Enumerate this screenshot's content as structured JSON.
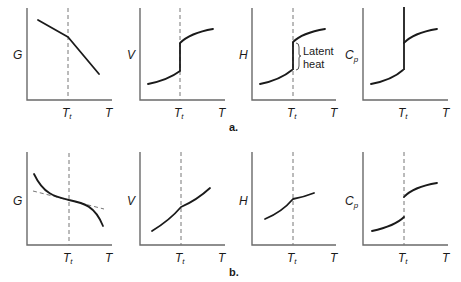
{
  "figure": {
    "part_labels": {
      "a": "a.",
      "b": "b."
    },
    "x_axis_label": "T",
    "transition_label": {
      "main": "T",
      "sub": "t"
    },
    "annotation": {
      "line1": "Latent",
      "line2": "heat"
    },
    "row_a": {
      "description": "First-order phase transition",
      "panels": [
        {
          "y_label": "G",
          "behavior": "continuous with slope discontinuity (kink) at Tt"
        },
        {
          "y_label": "V",
          "behavior": "discontinuous jump at Tt"
        },
        {
          "y_label": "H",
          "behavior": "discontinuous jump at Tt equal to latent heat"
        },
        {
          "y_label": "C",
          "y_sub": "p",
          "behavior": "diverges to infinity at Tt"
        }
      ]
    },
    "row_b": {
      "description": "Second-order phase transition",
      "panels": [
        {
          "y_label": "G",
          "behavior": "continuous, smooth; dashed tangent line at Tt"
        },
        {
          "y_label": "V",
          "behavior": "continuous with slope change at Tt"
        },
        {
          "y_label": "H",
          "behavior": "continuous with slope change at Tt"
        },
        {
          "y_label": "C",
          "y_sub": "p",
          "behavior": "finite discontinuous jump at Tt"
        }
      ]
    }
  }
}
